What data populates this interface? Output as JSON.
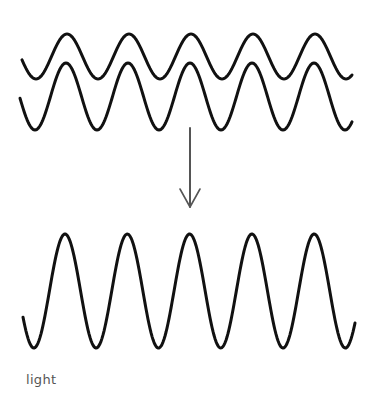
{
  "diagram": {
    "title": "",
    "label": "light",
    "colors": {
      "wave": "#111111",
      "arrow": "#555555",
      "label": "#555555",
      "background": "#ffffff"
    },
    "input_waves": [
      {
        "name": "wave-1",
        "x_start": 22,
        "x_end": 352,
        "peak_y": 34,
        "trough_y": 79,
        "first_peak_x": 67,
        "period": 62,
        "cycles": 5
      },
      {
        "name": "wave-2",
        "x_start": 20,
        "x_end": 352,
        "peak_y": 63,
        "trough_y": 130,
        "first_peak_x": 66,
        "period": 62,
        "cycles": 5
      }
    ],
    "arrow": {
      "x": 190,
      "y_start": 128,
      "y_end": 207,
      "head_width": 10,
      "head_length": 18,
      "direction": "down"
    },
    "result_wave": {
      "name": "combined-wave",
      "x_start": 23,
      "x_end": 355,
      "peak_y": 234,
      "trough_y": 348,
      "first_peak_x": 65,
      "period": 62.3,
      "cycles": 5
    }
  }
}
